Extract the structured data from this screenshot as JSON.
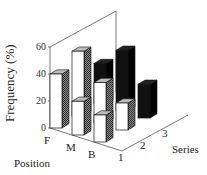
{
  "chart_data": {
    "type": "bar3d",
    "title": "",
    "ylabel": "Frequency (%)",
    "xlabel": "Position",
    "zlabel": "Series",
    "categories": [
      "F",
      "M",
      "B"
    ],
    "series_labels": [
      "1",
      "2",
      "3"
    ],
    "yticks": [
      "0",
      "20",
      "40",
      "60"
    ],
    "ylim": [
      0,
      60
    ],
    "series": [
      {
        "name": "1",
        "values": [
          40,
          25,
          20
        ]
      },
      {
        "name": "2",
        "values": [
          48,
          30,
          20
        ]
      },
      {
        "name": "3",
        "values": [
          30,
          45,
          25
        ]
      }
    ],
    "colors": {
      "front": "#ffffff",
      "side_light": "#666666",
      "dark": "#111111"
    }
  }
}
